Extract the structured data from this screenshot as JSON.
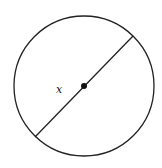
{
  "diagram": {
    "type": "circle-with-diameter",
    "circle": {
      "cx": 84,
      "cy": 86,
      "r": 70,
      "stroke": "#222222"
    },
    "diameter": {
      "x1": 35,
      "y1": 137,
      "x2": 133,
      "y2": 36
    },
    "center_point": {
      "cx": 84,
      "cy": 86,
      "r": 3
    },
    "label": {
      "text": "x",
      "x": 56,
      "y": 93
    }
  }
}
